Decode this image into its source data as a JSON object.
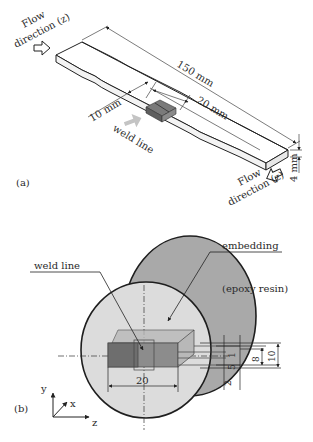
{
  "panel_a": {
    "label": "(a)",
    "flow_direction_left": {
      "line1": "Flow",
      "line2": "direction (z)"
    },
    "flow_direction_right": {
      "line1": "Flow",
      "line2": "direction (z)"
    },
    "dim_length": "150 mm",
    "dim_gauge_left": "10 mm",
    "dim_gauge_right": "20 mm",
    "dim_thickness": "4 mm",
    "weld_line": "weld line"
  },
  "panel_b": {
    "label": "(b)",
    "weld_line": "weld line",
    "embedding": "embedding",
    "epoxy_resin": "(epoxy resin)",
    "dim_width": "20",
    "dim_1": "1",
    "dim_2": "2",
    "dim_5": "5",
    "dim_8": "8",
    "dim_10": "10",
    "axes": {
      "y": "y",
      "x": "x",
      "z": "z"
    }
  },
  "colors": {
    "embedding_fill": "#a9a9a9",
    "inner_disk_fill": "#dcdcdc",
    "specimen_dark": "#6e6e6e",
    "specimen_mid": "#8c8c8c",
    "specimen_light": "#b8b8b8",
    "weld_arrow": "#c0c0c0",
    "line": "#1e1e1e"
  }
}
